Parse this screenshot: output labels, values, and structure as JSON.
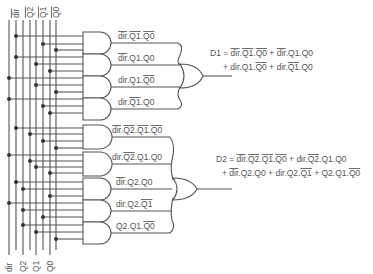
{
  "inputs": {
    "top_labels": [
      "dir",
      "Q2",
      "Q1",
      "Q0"
    ],
    "top_labels_inverted": true,
    "bottom_labels": [
      "dir",
      "Q2",
      "Q1",
      "Q0"
    ]
  },
  "group_d1": {
    "terms": [
      {
        "label": "dir.Q1.Q0",
        "overline": [
          "dir",
          "Q1",
          "Q0"
        ]
      },
      {
        "label": "dir.Q1.Q0",
        "overline": [
          "dir"
        ]
      },
      {
        "label": "dir.Q1.Q0",
        "overline": [
          "Q0"
        ]
      },
      {
        "label": "dir.Q1.Q0",
        "overline": [
          "Q1"
        ]
      }
    ],
    "equation_line1": "D1 = dir.Q1.Q0 + dir.Q1.Q0",
    "equation_line2": "+ dir.Q1.Q0 + dir.Q1.Q0"
  },
  "group_d2": {
    "terms": [
      {
        "label": "dir.Q2.Q1.Q0",
        "overline": [
          "dir",
          "Q2",
          "Q1",
          "Q0"
        ]
      },
      {
        "label": "dir.Q2.Q1.Q0",
        "overline": [
          "Q2"
        ]
      },
      {
        "label": "dir.Q2.Q0",
        "overline": [
          "dir"
        ]
      },
      {
        "label": "dir.Q2.Q1",
        "overline": [
          "Q1"
        ]
      },
      {
        "label": "Q2.Q1.Q0",
        "overline": [
          "Q0"
        ]
      }
    ],
    "equation_line1": "D2 = dir.Q2.Q1.Q0 + dir.Q2.Q1.Q0",
    "equation_line2": "+ dir.Q2.Q0 + dir.Q2.Q1 + Q2.Q1.Q0"
  },
  "colors": {
    "line": "#555555",
    "dot": "#333333",
    "background": "#ffffff"
  }
}
